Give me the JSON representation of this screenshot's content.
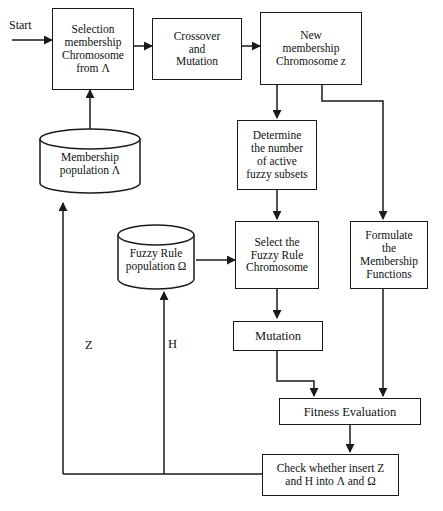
{
  "diagram": {
    "stroke_color": "#1a1a1a",
    "background_color": "#ffffff"
  },
  "nodes": {
    "selection_membership": {
      "label": "Selection\nmembership\nChromosome\nfrom Λ",
      "shape": "rectangle"
    },
    "crossover_mutation": {
      "label": "Crossover\nand\nMutation",
      "shape": "rectangle"
    },
    "new_membership": {
      "label": "New\nmembership\nChromosome z",
      "shape": "rectangle"
    },
    "membership_population": {
      "label": "Membership\npopulation Λ",
      "shape": "cylinder"
    },
    "determine_active": {
      "label": "Determine\nthe number\nof active\nfuzzy subsets",
      "shape": "rectangle"
    },
    "fuzzy_rule_population": {
      "label": "Fuzzy Rule\npopulation Ω",
      "shape": "cylinder"
    },
    "select_fuzzy_rule": {
      "label": "Select the\nFuzzy Rule\nChromosome",
      "shape": "rectangle"
    },
    "formulate_membership": {
      "label": "Formulate\nthe\nMembership\nFunctions",
      "shape": "rectangle"
    },
    "mutation": {
      "label": "Mutation",
      "shape": "rectangle"
    },
    "fitness_evaluation": {
      "label": "Fitness Evaluation",
      "shape": "rectangle"
    },
    "check_insert": {
      "label": "Check whether insert Z\nand H into Λ and Ω",
      "shape": "rectangle"
    }
  },
  "annotations": {
    "start": "Start",
    "edge_z": "Z",
    "edge_h": "H"
  }
}
